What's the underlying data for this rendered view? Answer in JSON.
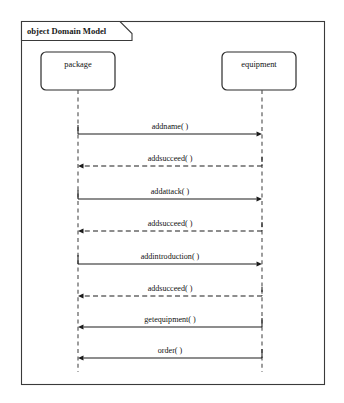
{
  "frame": {
    "keyword": "object",
    "name": "Domain Model",
    "title": "object Domain Model"
  },
  "lifelines": [
    {
      "id": "package",
      "label": "package",
      "x": 78
    },
    {
      "id": "equipment",
      "label": "equipment",
      "x": 262
    }
  ],
  "messages": [
    {
      "index": 1,
      "label": "addname( )",
      "from": "package",
      "to": "equipment",
      "style": "solid",
      "direction": "right",
      "y": 134
    },
    {
      "index": 2,
      "label": "addsucceed( )",
      "from": "equipment",
      "to": "package",
      "style": "dashed",
      "direction": "left",
      "y": 166
    },
    {
      "index": 3,
      "label": "addattack( )",
      "from": "package",
      "to": "equipment",
      "style": "solid",
      "direction": "right",
      "y": 199
    },
    {
      "index": 4,
      "label": "addsucceed( )",
      "from": "equipment",
      "to": "package",
      "style": "dashed",
      "direction": "left",
      "y": 231
    },
    {
      "index": 5,
      "label": "addintroduction( )",
      "from": "package",
      "to": "equipment",
      "style": "solid",
      "direction": "right",
      "y": 264
    },
    {
      "index": 6,
      "label": "addsucceed( )",
      "from": "equipment",
      "to": "package",
      "style": "dashed",
      "direction": "left",
      "y": 296
    },
    {
      "index": 7,
      "label": "getequipment( )",
      "from": "equipment",
      "to": "package",
      "style": "solid",
      "direction": "left",
      "y": 327
    },
    {
      "index": 8,
      "label": "order( )",
      "from": "equipment",
      "to": "package",
      "style": "solid",
      "direction": "left",
      "y": 358
    }
  ],
  "colors": {
    "background": "#ffffff",
    "frame_stroke": "#3a3a3a",
    "box_stroke": "#2b2b2b",
    "lifeline_stroke": "#555555",
    "message_stroke": "#1c1c1c",
    "text": "#111111"
  }
}
